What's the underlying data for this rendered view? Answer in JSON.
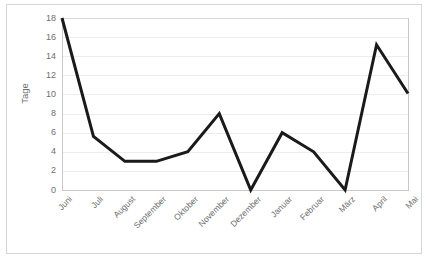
{
  "chart_data": {
    "type": "line",
    "title": "",
    "xlabel": "",
    "ylabel": "Tage",
    "categories": [
      "Juni",
      "Juli",
      "August",
      "September",
      "Oktober",
      "November",
      "Dezember",
      "Januar",
      "Februar",
      "März",
      "April",
      "Mai"
    ],
    "values": [
      18,
      5.6,
      3,
      3,
      4,
      8,
      0,
      6,
      4,
      0,
      15.2,
      10.1
    ],
    "series": [
      {
        "name": "Tage",
        "values": [
          18,
          5.6,
          3,
          3,
          4,
          8,
          0,
          6,
          4,
          0,
          15.2,
          10.1
        ],
        "color": "#1a1a1a"
      }
    ],
    "ylim": [
      0,
      18
    ],
    "ytick_values": [
      0,
      2,
      4,
      6,
      8,
      10,
      12,
      14,
      16,
      18
    ],
    "ytick_labels": [
      "0",
      "2",
      "4",
      "6",
      "8",
      "10",
      "12",
      "14",
      "16",
      "18"
    ],
    "grid": true,
    "grid_axis": "y",
    "grid_color": "#ededed",
    "legend": false,
    "legend_position": "none",
    "xtick_rotation": -45,
    "line_width": 3,
    "markers": false,
    "plot_background": "#ffffff",
    "frame_color": "#d6d6d6",
    "axis_color": "#c9c9c9",
    "tick_text_color": "#6e6e6e"
  },
  "axes": {
    "y_title": "Tage"
  }
}
